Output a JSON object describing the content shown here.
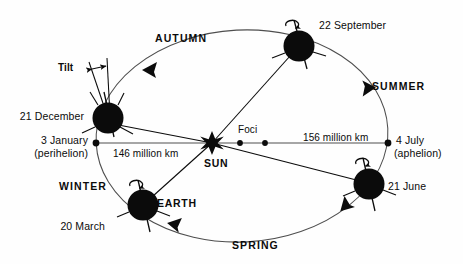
{
  "diagram": {
    "colors": {
      "ink": "#0b0b0b",
      "orbit_line": "#5a5a5a",
      "background": "#fefefe"
    },
    "sun": {
      "label": "SUN",
      "icon": "sun-star-icon"
    },
    "foci": {
      "label": "Foci",
      "count": 2
    },
    "earth_label": "EARTH",
    "tilt_label": "Tilt",
    "distances": [
      {
        "key": "perihelion_distance",
        "text": "146 million km"
      },
      {
        "key": "aphelion_distance",
        "text": "156 million km"
      }
    ],
    "orbit_positions": [
      {
        "id": "december-solstice",
        "date": "21 December",
        "note": "",
        "icon": "earth-globe-icon"
      },
      {
        "id": "september-equinox",
        "date": "22 September",
        "note": "",
        "icon": "earth-globe-icon"
      },
      {
        "id": "march-equinox",
        "date": "20 March",
        "note": "",
        "icon": "earth-globe-icon"
      },
      {
        "id": "june-solstice",
        "date": "21 June",
        "note": "",
        "icon": "earth-globe-icon"
      }
    ],
    "orbit_markers": [
      {
        "id": "perihelion",
        "date": "3 January",
        "note": "(perihelion)",
        "icon": "orbit-point-icon"
      },
      {
        "id": "aphelion",
        "date": "4 July",
        "note": "(aphelion)",
        "icon": "orbit-point-icon"
      }
    ],
    "seasons": [
      {
        "id": "autumn",
        "label": "AUTUMN"
      },
      {
        "id": "summer",
        "label": "SUMMER"
      },
      {
        "id": "winter",
        "label": "WINTER"
      },
      {
        "id": "spring",
        "label": "SPRING"
      }
    ]
  }
}
